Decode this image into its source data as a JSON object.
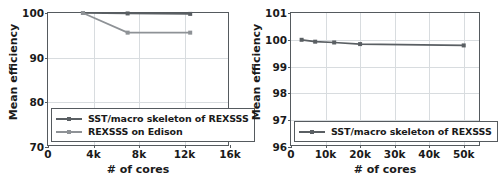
{
  "chart_data": [
    {
      "id": "left",
      "type": "line",
      "title": "",
      "xlabel": "# of cores",
      "ylabel": "Mean efficiency",
      "xlim": [
        0,
        16000
      ],
      "ylim": [
        70,
        100
      ],
      "xticks": [
        0,
        4000,
        8000,
        12000,
        16000
      ],
      "xticklabels": [
        "0",
        "4k",
        "8k",
        "12k",
        "16k"
      ],
      "yticks": [
        70,
        80,
        90,
        100
      ],
      "yticklabels": [
        "70",
        "80",
        "90",
        "100"
      ],
      "grid": true,
      "legend_position": "lower left",
      "series": [
        {
          "name": "SST/macro skeleton of REXSSS",
          "color": "#5a5f63",
          "marker": "square",
          "x": [
            3072,
            7000,
            12500
          ],
          "y": [
            100.0,
            99.9,
            99.8
          ]
        },
        {
          "name": "REXSSS on Edison",
          "color": "#8e9296",
          "marker": "square",
          "x": [
            3072,
            7000,
            12500
          ],
          "y": [
            100.0,
            95.6,
            95.6
          ]
        }
      ]
    },
    {
      "id": "right",
      "type": "line",
      "title": "",
      "xlabel": "# of cores",
      "ylabel": "Mean efficiency",
      "xlim": [
        0,
        55000
      ],
      "ylim": [
        96,
        101
      ],
      "xticks": [
        0,
        10000,
        20000,
        30000,
        40000,
        50000
      ],
      "xticklabels": [
        "0",
        "10k",
        "20k",
        "30k",
        "40k",
        "50k"
      ],
      "yticks": [
        96,
        97,
        98,
        99,
        100,
        101
      ],
      "yticklabels": [
        "96",
        "97",
        "98",
        "99",
        "100",
        "101"
      ],
      "grid": true,
      "legend_position": "lower left",
      "series": [
        {
          "name": "SST/macro skeleton of REXSSS",
          "color": "#5a5f63",
          "marker": "square",
          "x": [
            3072,
            7000,
            12500,
            20000,
            50000
          ],
          "y": [
            100.0,
            99.93,
            99.9,
            99.84,
            99.79
          ]
        }
      ]
    }
  ]
}
